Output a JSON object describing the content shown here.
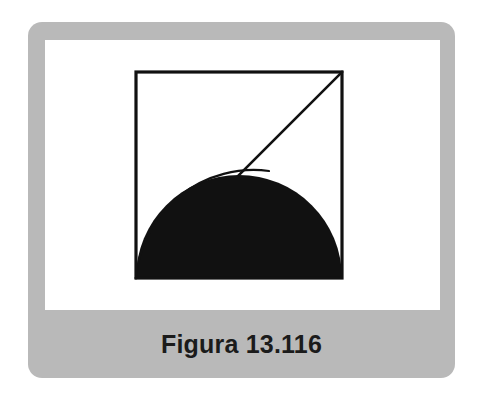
{
  "page": {
    "background_color": "#ffffff",
    "width": 483,
    "height": 407
  },
  "card": {
    "background_color": "#b9b9b9",
    "corner_radius": 14
  },
  "panel": {
    "background_color": "#ffffff"
  },
  "caption": {
    "text": "Figura 13.116",
    "color": "#1b1b1b",
    "weight": "bold",
    "size_px": 25
  },
  "figure": {
    "title": "Figura 13.116",
    "stroke_color": "#111111",
    "fill_color": "#111111",
    "background_color": "#ffffff",
    "square": {
      "label": "square",
      "x": 91,
      "y": 32,
      "side": 206,
      "stroke_width": 3.2
    },
    "diagonal": {
      "label": "diagonal",
      "from": [
        91,
        238
      ],
      "to": [
        297,
        32
      ],
      "stroke_width": 2.6
    },
    "semicircle": {
      "label": "shaded-semicircle",
      "center": [
        194,
        238
      ],
      "radius": 103,
      "orientation": "upper-half",
      "filled": true
    },
    "arc": {
      "label": "thin-arc",
      "from": [
        91,
        238
      ],
      "to": [
        224,
        131
      ],
      "sweep": "convex-upward",
      "radius": 118,
      "stroke_width": 2.2
    }
  }
}
